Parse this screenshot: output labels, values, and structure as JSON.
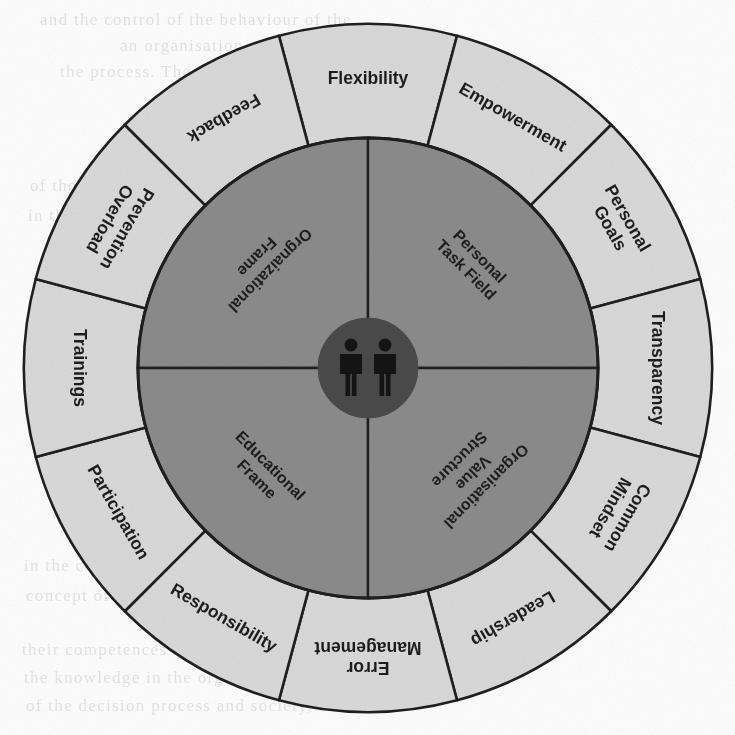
{
  "figure": {
    "type": "concentric-wheel-diagram",
    "center": {
      "x": 368,
      "y": 368
    },
    "colors": {
      "outer_ring_fill": "#d9d9d9",
      "inner_disc_fill": "#8b8b8b",
      "core_fill": "#4a4a4a",
      "stroke": "#1f1f1f",
      "label_text": "#1d1d1d",
      "background": "#fdfdfd"
    },
    "radii": {
      "outer": 344,
      "inner_disc": 230,
      "core": 50
    }
  },
  "core": {
    "icon_name": "two-people-icon",
    "figure_count": 2
  },
  "outer_ring": {
    "sector_count": 12,
    "sectors": [
      {
        "label": "Flexibility",
        "mid_angle_deg": 270,
        "multiline": false
      },
      {
        "label": "Empowerment",
        "mid_angle_deg": 300,
        "multiline": false
      },
      {
        "label": "Personal\nGoals",
        "mid_angle_deg": 330,
        "multiline": true
      },
      {
        "label": "Transparency",
        "mid_angle_deg": 0,
        "multiline": false
      },
      {
        "label": "Common\nMindset",
        "mid_angle_deg": 30,
        "multiline": true
      },
      {
        "label": "Leadership",
        "mid_angle_deg": 60,
        "multiline": false
      },
      {
        "label": "Error\nManagement",
        "mid_angle_deg": 90,
        "multiline": true
      },
      {
        "label": "Responsibility",
        "mid_angle_deg": 120,
        "multiline": false
      },
      {
        "label": "Participation",
        "mid_angle_deg": 150,
        "multiline": false
      },
      {
        "label": "Trainings",
        "mid_angle_deg": 180,
        "multiline": false
      },
      {
        "label": "Prevention\nOverload",
        "mid_angle_deg": 210,
        "multiline": true
      },
      {
        "label": "Feedback",
        "mid_angle_deg": 240,
        "multiline": false
      }
    ]
  },
  "inner_disc": {
    "quadrant_count": 4,
    "quadrants": [
      {
        "label": "Orgnaizational\nFrame",
        "position": "top-left",
        "mid_angle_deg": 225
      },
      {
        "label": "Personal\nTask Field",
        "position": "top-right",
        "mid_angle_deg": 315
      },
      {
        "label": "Educational\nFrame",
        "position": "bottom-left",
        "mid_angle_deg": 135
      },
      {
        "label": "Organisational\nValue\nStructure",
        "position": "bottom-right",
        "mid_angle_deg": 45
      }
    ]
  },
  "background_bleed": {
    "visible": true,
    "lines": [
      {
        "text": "and the control of the behaviour of the",
        "x": 40,
        "y": 10
      },
      {
        "text": "an organisation and the level of the",
        "x": 120,
        "y": 36
      },
      {
        "text": "the process. The organisation of the",
        "x": 60,
        "y": 62
      },
      {
        "text": "of the system in",
        "x": 30,
        "y": 176
      },
      {
        "text": "in the contextual",
        "x": 28,
        "y": 206
      },
      {
        "text": "the processes",
        "x": 34,
        "y": 404
      },
      {
        "text": "in the context of the organisation the",
        "x": 24,
        "y": 556
      },
      {
        "text": "concept of the environment and the",
        "x": 26,
        "y": 586
      },
      {
        "text": "their competences and the quality of the",
        "x": 22,
        "y": 640
      },
      {
        "text": "the knowledge in the organisation for the",
        "x": 24,
        "y": 668
      },
      {
        "text": "of the decision process and society, this",
        "x": 26,
        "y": 696
      }
    ]
  }
}
